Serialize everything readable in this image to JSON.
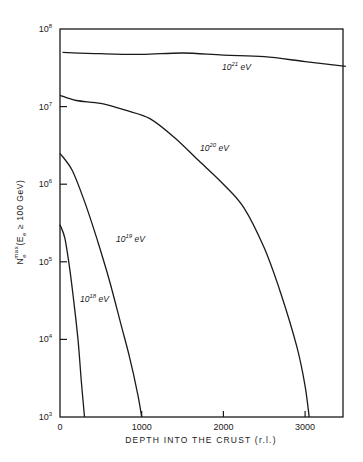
{
  "chart_data": {
    "type": "line",
    "title": "",
    "xlabel": "DEPTH INTO THE CRUST (r.l.)",
    "ylabel": "N_e^max (E_e ≥ 100 GeV)",
    "yscale": "log",
    "xlim": [
      0,
      3500
    ],
    "ylim": [
      1000,
      100000000
    ],
    "grid": false,
    "legend": "inline labels",
    "x_ticks": [
      0,
      1000,
      2000,
      3000
    ],
    "x_tick_labels": [
      "0",
      "1000",
      "2000",
      "3000"
    ],
    "y_ticks": [
      1000,
      10000,
      100000,
      1000000,
      10000000,
      100000000
    ],
    "y_tick_labels": [
      {
        "base": "10",
        "exp": "3"
      },
      {
        "base": "10",
        "exp": "4"
      },
      {
        "base": "10",
        "exp": "5"
      },
      {
        "base": "10",
        "exp": "6"
      },
      {
        "base": "10",
        "exp": "7"
      },
      {
        "base": "10",
        "exp": "8"
      }
    ],
    "series": [
      {
        "name": "10^21 eV",
        "label_base": "10",
        "label_exp": "21",
        "label_unit": "eV",
        "x": [
          30,
          500,
          1000,
          1500,
          2000,
          2500,
          3000,
          3500
        ],
        "values": [
          50000000,
          48000000,
          47000000,
          49000000,
          46000000,
          44000000,
          38000000,
          33000000
        ]
      },
      {
        "name": "10^20 eV",
        "label_base": "10",
        "label_exp": "20",
        "label_exp_display": "20",
        "label_unit": "eV",
        "x": [
          0,
          200,
          500,
          800,
          1100,
          1400,
          1700,
          2000,
          2250,
          2500,
          2700,
          2900,
          3000,
          3050
        ],
        "values": [
          14000000,
          12000000,
          11000000,
          9000000,
          7000000,
          4000000,
          2000000,
          1000000,
          500000,
          150000,
          40000,
          8000,
          2500,
          1000
        ]
      },
      {
        "name": "10^19 eV",
        "label_base": "10",
        "label_exp": "19",
        "label_unit": "eV",
        "x": [
          0,
          150,
          300,
          450,
          600,
          750,
          850,
          950,
          1000
        ],
        "values": [
          2500000,
          1500000,
          600000,
          200000,
          60000,
          15000,
          6000,
          2000,
          1000
        ]
      },
      {
        "name": "10^18 eV",
        "label_base": "10",
        "label_exp": "18",
        "label_unit": "eV",
        "x": [
          0,
          60,
          120,
          170,
          220,
          260,
          300
        ],
        "values": [
          300000,
          200000,
          80000,
          30000,
          10000,
          3000,
          1000
        ]
      }
    ]
  },
  "axes": {
    "x_title": "DEPTH INTO THE CRUST (r.l.)",
    "y_title_main": "N",
    "y_title_sub": "e",
    "y_title_sup": "max",
    "y_title_rest": "(E",
    "y_title_rest_sub": "e",
    "y_title_tail": " ≥ 100 GeV)"
  }
}
